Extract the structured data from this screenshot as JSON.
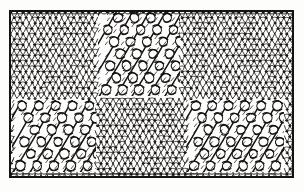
{
  "figure": {
    "title": "Knitted fabric swatch with diagonal lace panels",
    "medium": "black-and-white engraved line illustration",
    "background_color": "#fdfdfb",
    "ink_color": "#15130f",
    "fabric_color": "#ffffff",
    "frame": {
      "x": 9,
      "y": 10,
      "width": 285,
      "height": 168,
      "border_color": "#15130f",
      "border_width": 2
    },
    "ground": {
      "name": "stockinette-ground",
      "stitch_type": "stockinette / plain knit V-stitches",
      "stitch_width": 6.0,
      "stitch_height": 5.4,
      "columns": 47,
      "rows": 31
    },
    "lace_panels": [
      {
        "name": "upper-lace-panel",
        "position": "upper centre-right",
        "x": 98,
        "y": 12,
        "width": 82,
        "height": 84,
        "diagonal": "lower-left to upper-right",
        "eyelet_columns": 5,
        "eyelet_rows": 7,
        "stitch_type": "eyelet openwork with travelling decreases"
      },
      {
        "name": "lower-left-lace-panel",
        "position": "lower left",
        "x": 12,
        "y": 100,
        "width": 84,
        "height": 72,
        "diagonal": "lower-left to upper-right",
        "eyelet_columns": 5,
        "eyelet_rows": 6,
        "stitch_type": "eyelet openwork with travelling decreases"
      },
      {
        "name": "lower-right-lace-panel",
        "position": "lower right",
        "x": 186,
        "y": 100,
        "width": 98,
        "height": 72,
        "diagonal": "lower-left to upper-right",
        "eyelet_columns": 6,
        "eyelet_rows": 6,
        "stitch_type": "eyelet openwork with travelling decreases"
      }
    ]
  }
}
